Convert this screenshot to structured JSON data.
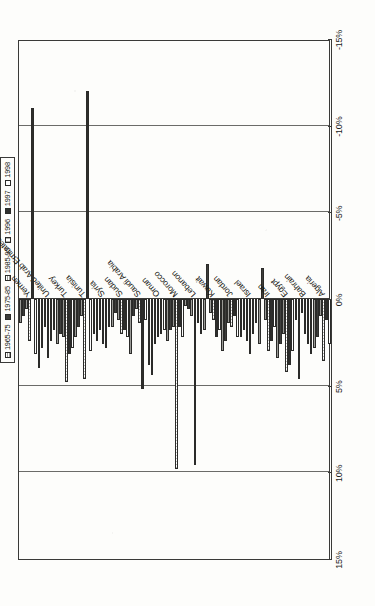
{
  "chart_data": {
    "type": "bar",
    "orientation": "horizontal",
    "title": "",
    "xlabel": "",
    "ylabel": "",
    "xlim": [
      -15,
      15
    ],
    "reversed_axis": true,
    "grid": true,
    "legend_position": "top",
    "tick_labels": [
      "15%",
      "10%",
      "5%",
      "0%",
      "-5%",
      "-10%",
      "-15%"
    ],
    "tick_values": [
      15,
      10,
      5,
      0,
      -5,
      -10,
      -15
    ],
    "categories": [
      "Algeria",
      "Bahrain",
      "Egypt",
      "Iran",
      "Israel",
      "Jordan",
      "Kuwait",
      "Lebanon",
      "Morocco",
      "Oman",
      "Saudi Arabia",
      "Sudan",
      "Syria",
      "Tunisia",
      "Turkey",
      "United Arab Emirates",
      "Yemen"
    ],
    "series": [
      {
        "name": "1965-75",
        "values": [
          2.8,
          1.2,
          3.4,
          2.6,
          2.2,
          3.0,
          1.8,
          0.4,
          2.4,
          3.8,
          3.2,
          1.6,
          2.0,
          2.2,
          2.6,
          4.0,
          1.4
        ]
      },
      {
        "name": "1975-85",
        "values": [
          2.2,
          4.6,
          2.6,
          -1.8,
          1.8,
          2.4,
          -2.0,
          0.6,
          1.8,
          4.4,
          1.0,
          0.8,
          2.4,
          1.6,
          2.0,
          2.8,
          1.0
        ]
      },
      {
        "name": "1985-95",
        "values": [
          1.0,
          0.8,
          2.0,
          1.2,
          2.4,
          1.4,
          0.8,
          1.0,
          1.6,
          2.6,
          0.6,
          1.2,
          1.8,
          1.0,
          2.2,
          1.6,
          0.6
        ]
      },
      {
        "name": "1996",
        "values": [
          3.6,
          2.0,
          4.2,
          3.0,
          3.2,
          1.6,
          1.2,
          9.6,
          9.8,
          2.2,
          1.4,
          2.0,
          2.6,
          4.6,
          4.8,
          3.4,
          2.4
        ]
      },
      {
        "name": "1997",
        "values": [
          1.2,
          2.6,
          3.8,
          2.4,
          2.0,
          1.0,
          2.2,
          1.4,
          1.6,
          2.0,
          5.2,
          1.8,
          2.8,
          -12.0,
          3.2,
          2.4,
          -11.0
        ]
      },
      {
        "name": "1998",
        "values": [
          2.6,
          3.2,
          3.0,
          1.6,
          1.4,
          2.2,
          1.8,
          2.0,
          2.2,
          1.8,
          1.2,
          2.2,
          1.6,
          3.0,
          2.8,
          1.8,
          3.2
        ]
      }
    ]
  },
  "legend": {
    "items": [
      {
        "label": "1965-75",
        "swatch": "hatch-light"
      },
      {
        "label": "1975-85",
        "swatch": "solid-dark"
      },
      {
        "label": "1985-95",
        "swatch": "hatch-light"
      },
      {
        "label": "1996",
        "swatch": "hatch-vertical"
      },
      {
        "label": "1997",
        "swatch": "solid-dark"
      },
      {
        "label": "1998",
        "swatch": "white"
      }
    ]
  },
  "colors": {
    "frame": "#3a3a38",
    "gridline": "#6b6b68",
    "bar_outline": "#2b2b29",
    "bar_dark": "#3d3d3b",
    "bar_light": "#ffffff",
    "background": "#fdfdfb",
    "text": "#15150f"
  }
}
